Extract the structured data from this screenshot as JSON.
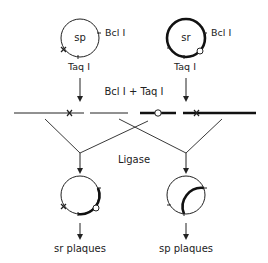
{
  "diagram": {
    "top_left_plasmid": {
      "label": "sp",
      "site_1": "Bcl I",
      "site_2": "Taq I"
    },
    "top_right_plasmid": {
      "label": "sr",
      "site_1": "Bcl I",
      "site_2": "Taq I"
    },
    "digest_label": "Bcl I + Taq I",
    "ligation_label": "Ligase",
    "bottom_left_result": "sr plaques",
    "bottom_right_result": "sp plaques"
  },
  "colors": {
    "line": "#222222",
    "background": "#ffffff"
  }
}
